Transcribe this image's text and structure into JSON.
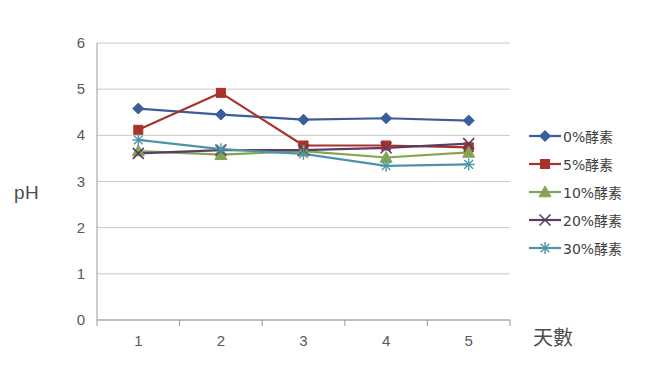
{
  "chart_data": {
    "type": "line",
    "title": "",
    "xlabel": "天數",
    "ylabel": "pH",
    "categories": [
      "1",
      "2",
      "3",
      "4",
      "5"
    ],
    "x": [
      1,
      2,
      3,
      4,
      5
    ],
    "xlim": [
      1,
      5
    ],
    "ylim": [
      0,
      6
    ],
    "y_ticks": [
      "0",
      "1",
      "2",
      "3",
      "4",
      "5",
      "6"
    ],
    "y_tick_values": [
      0,
      1,
      2,
      3,
      4,
      5,
      6
    ],
    "grid": "horizontal",
    "legend_position": "right",
    "series": [
      {
        "name": "0%酵素",
        "color": "#3B5E9B",
        "marker": "diamond",
        "values": [
          4.58,
          4.45,
          4.34,
          4.37,
          4.32
        ]
      },
      {
        "name": "5%酵素",
        "color": "#A8332A",
        "marker": "square",
        "values": [
          4.12,
          4.92,
          3.78,
          3.78,
          3.74
        ]
      },
      {
        "name": "10%酵素",
        "color": "#84A551",
        "marker": "triangle",
        "values": [
          3.66,
          3.58,
          3.66,
          3.52,
          3.63
        ]
      },
      {
        "name": "20%酵素",
        "color": "#5B3C66",
        "marker": "x",
        "values": [
          3.61,
          3.68,
          3.68,
          3.73,
          3.82
        ]
      },
      {
        "name": "30%酵素",
        "color": "#4E94A8",
        "marker": "asterisk",
        "values": [
          3.9,
          3.7,
          3.6,
          3.34,
          3.37
        ]
      }
    ]
  },
  "axes": {
    "y_label": "pH",
    "x_label": "天數"
  },
  "colors": {
    "gridline": "#C9C9C9",
    "axis": "#9a9a9a",
    "text": "#595959",
    "background": "#ffffff"
  }
}
